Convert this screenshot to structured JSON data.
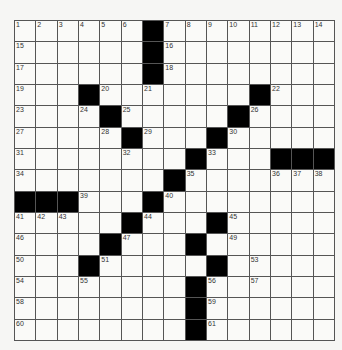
{
  "puzzle": {
    "rows": 15,
    "cols": 15,
    "colors": {
      "black": "#000000",
      "white": "#fafaf8",
      "gridline": "#555555"
    },
    "grid": [
      "......#........",
      "......#........",
      "......#........",
      "...#.......#...",
      "....#.....#....",
      ".....#...#.....",
      "........#...###",
      ".......#.......",
      "###...#........",
      ".....#...#.....",
      "....#...#......",
      "...#.....#.....",
      "........#......",
      "........#......",
      "........#......"
    ],
    "numbers": [
      {
        "r": 0,
        "c": 0,
        "n": "1"
      },
      {
        "r": 0,
        "c": 1,
        "n": "2"
      },
      {
        "r": 0,
        "c": 2,
        "n": "3"
      },
      {
        "r": 0,
        "c": 3,
        "n": "4"
      },
      {
        "r": 0,
        "c": 4,
        "n": "5"
      },
      {
        "r": 0,
        "c": 5,
        "n": "6"
      },
      {
        "r": 0,
        "c": 7,
        "n": "7"
      },
      {
        "r": 0,
        "c": 8,
        "n": "8"
      },
      {
        "r": 0,
        "c": 9,
        "n": "9"
      },
      {
        "r": 0,
        "c": 10,
        "n": "10"
      },
      {
        "r": 0,
        "c": 11,
        "n": "11"
      },
      {
        "r": 0,
        "c": 12,
        "n": "12"
      },
      {
        "r": 0,
        "c": 13,
        "n": "13"
      },
      {
        "r": 0,
        "c": 14,
        "n": "14"
      },
      {
        "r": 1,
        "c": 0,
        "n": "15"
      },
      {
        "r": 1,
        "c": 7,
        "n": "16"
      },
      {
        "r": 2,
        "c": 0,
        "n": "17"
      },
      {
        "r": 2,
        "c": 7,
        "n": "18"
      },
      {
        "r": 3,
        "c": 0,
        "n": "19"
      },
      {
        "r": 3,
        "c": 4,
        "n": "20"
      },
      {
        "r": 3,
        "c": 6,
        "n": "21"
      },
      {
        "r": 3,
        "c": 12,
        "n": "22"
      },
      {
        "r": 4,
        "c": 0,
        "n": "23"
      },
      {
        "r": 4,
        "c": 3,
        "n": "24"
      },
      {
        "r": 4,
        "c": 5,
        "n": "25"
      },
      {
        "r": 4,
        "c": 11,
        "n": "26"
      },
      {
        "r": 5,
        "c": 0,
        "n": "27"
      },
      {
        "r": 5,
        "c": 4,
        "n": "28"
      },
      {
        "r": 5,
        "c": 6,
        "n": "29"
      },
      {
        "r": 5,
        "c": 10,
        "n": "30"
      },
      {
        "r": 6,
        "c": 0,
        "n": "31"
      },
      {
        "r": 6,
        "c": 5,
        "n": "32"
      },
      {
        "r": 6,
        "c": 9,
        "n": "33"
      },
      {
        "r": 7,
        "c": 0,
        "n": "34"
      },
      {
        "r": 7,
        "c": 8,
        "n": "35"
      },
      {
        "r": 7,
        "c": 12,
        "n": "36"
      },
      {
        "r": 7,
        "c": 13,
        "n": "37"
      },
      {
        "r": 7,
        "c": 14,
        "n": "38"
      },
      {
        "r": 8,
        "c": 3,
        "n": "39"
      },
      {
        "r": 8,
        "c": 7,
        "n": "40"
      },
      {
        "r": 9,
        "c": 0,
        "n": "41"
      },
      {
        "r": 9,
        "c": 1,
        "n": "42"
      },
      {
        "r": 9,
        "c": 2,
        "n": "43"
      },
      {
        "r": 9,
        "c": 6,
        "n": "44"
      },
      {
        "r": 9,
        "c": 10,
        "n": "45"
      },
      {
        "r": 10,
        "c": 0,
        "n": "46"
      },
      {
        "r": 10,
        "c": 5,
        "n": "47"
      },
      {
        "r": 10,
        "c": 8,
        "n": "48"
      },
      {
        "r": 10,
        "c": 10,
        "n": "49"
      },
      {
        "r": 11,
        "c": 0,
        "n": "50"
      },
      {
        "r": 11,
        "c": 4,
        "n": "51"
      },
      {
        "r": 11,
        "c": 9,
        "n": "52"
      },
      {
        "r": 11,
        "c": 11,
        "n": "53"
      },
      {
        "r": 12,
        "c": 0,
        "n": "54"
      },
      {
        "r": 12,
        "c": 3,
        "n": "55"
      },
      {
        "r": 12,
        "c": 9,
        "n": "56"
      },
      {
        "r": 12,
        "c": 11,
        "n": "57"
      },
      {
        "r": 13,
        "c": 0,
        "n": "58"
      },
      {
        "r": 13,
        "c": 9,
        "n": "59"
      },
      {
        "r": 14,
        "c": 0,
        "n": "60"
      },
      {
        "r": 14,
        "c": 9,
        "n": "61"
      }
    ]
  }
}
